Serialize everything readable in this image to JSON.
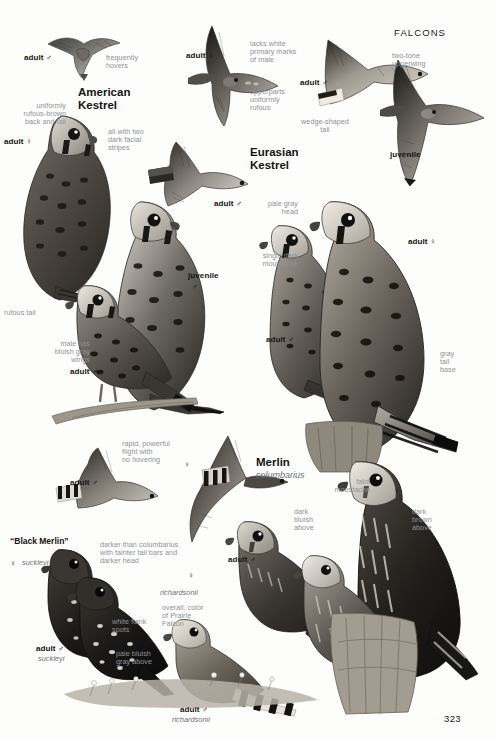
{
  "page": {
    "header": "FALCONS",
    "number": "323",
    "paper_color": "#fdfdfb",
    "ink_color": "#141414",
    "note_color": "#8e9298"
  },
  "species": [
    {
      "id": "american-kestrel",
      "common_name": "American\nKestrel",
      "scientific_name": ""
    },
    {
      "id": "eurasian-kestrel",
      "common_name": "Eurasian\nKestrel",
      "scientific_name": ""
    },
    {
      "id": "merlin",
      "common_name": "Merlin",
      "scientific_name": "columbarius"
    },
    {
      "id": "black-merlin",
      "common_name": "“Black Merlin”",
      "scientific_name": "suckleyi"
    }
  ],
  "labels": {
    "ak_adult_male_flight": "adult ♂",
    "ak_frequently_hovers": "frequently\nhovers",
    "ak_uniformly_rufous": "uniformly\nrufous-brown\nback and tail",
    "ak_adult_female": "adult ♀",
    "ak_two_stripes": "all with two\ndark facial\nstripes",
    "ak_adult_male_glide": "adult ♂",
    "ak_rufous_tail": "rufous tail",
    "ak_juvenile": "juvenile",
    "ak_juvenile_sym": "♂",
    "ak_bluish_gray_wings": "male has\nbluish gray\nwings",
    "ak_adult_male_perched": "adult ♂",
    "ek_adult_female_flight": "adult ♀",
    "ek_lacks_white": "lacks white\nprimary marks\nof male",
    "ek_upperparts": "upperparts\nuniformly\nrufous",
    "ek_adult_male_flight": "adult ♂",
    "ek_two_tone": "two-tone\nupperwing",
    "ek_wedge_tail": "wedge-shaped\ntail",
    "ek_juvenile": "juvenile",
    "ek_pale_gray_head": "pale gray\nhead",
    "ek_single_moustache": "single dark\nmoustache",
    "ek_adult_female": "adult ♀",
    "ek_adult_male": "adult ♂",
    "ek_gray_tail_base": "gray\ntail\nbase",
    "me_adult_male_flight": "adult ♂",
    "me_rapid_flight": "rapid, powerful\nflight with\nno hovering",
    "me_female_sym": "♀",
    "me_faint_moustache": "faint\nmoustache",
    "me_dark_bluish": "dark\nbluish\nabove",
    "me_dark_brown": "dark\nbrown\nabove",
    "me_female_sym2": "♀",
    "me_adult_male_perched": "adult ♂",
    "bm_female_sym": "♀",
    "bm_suckleyi_f": "suckleyi",
    "bm_darker_than": "darker than columbarius\nwith fainter tail bars and\ndarker head",
    "bm_white_flank": "white flank\nspots",
    "bm_adult_male": "adult ♂",
    "bm_suckleyi_m": "suckleyi",
    "ri_female_sym": "♀",
    "ri_richardsonii_f": "richardsonii",
    "ri_overall_color": "overall, color\nof Prairie\nFalcon",
    "ri_pale_bluish": "pale bluish\ngray above",
    "ri_adult_male": "adult ♂",
    "ri_richardsonii_m": "richardsonii"
  }
}
